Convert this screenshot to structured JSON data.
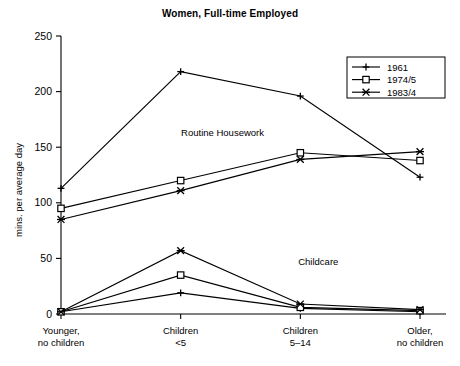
{
  "chart_data": {
    "type": "line",
    "title": "Women, Full-time Employed",
    "xlabel": "",
    "ylabel": "mins. per average day",
    "ylim": [
      0,
      250
    ],
    "yticks": [
      0,
      50,
      100,
      150,
      200,
      250
    ],
    "ytick_labels": [
      "0",
      "50",
      "100",
      "150",
      "200",
      "250"
    ],
    "grid": false,
    "legend_position": "top-right",
    "categories": [
      "Younger,\nno children",
      "Children\n<5",
      "Children\n5–14",
      "Older,\nno children"
    ],
    "category_lines": [
      [
        "Younger,",
        "no children"
      ],
      [
        "Children",
        "<5"
      ],
      [
        "Children",
        "5–14"
      ],
      [
        "Older,",
        "no children"
      ]
    ],
    "annotations": [
      {
        "text": "Routine Housework",
        "x_cat": 1.35,
        "y": 160
      },
      {
        "text": "Childcare",
        "x_cat": 2.15,
        "y": 44
      }
    ],
    "groups": [
      {
        "name": "Routine Housework",
        "series": [
          {
            "name": "1961",
            "marker": "plus",
            "values": [
              113,
              218,
              196,
              123
            ]
          },
          {
            "name": "1974/5",
            "marker": "square",
            "values": [
              95,
              120,
              145,
              138
            ]
          },
          {
            "name": "1983/4",
            "marker": "cross",
            "values": [
              85,
              111,
              139,
              146
            ]
          }
        ]
      },
      {
        "name": "Childcare",
        "series": [
          {
            "name": "1961",
            "marker": "plus",
            "values": [
              2,
              19,
              5,
              2
            ]
          },
          {
            "name": "1974/5",
            "marker": "square",
            "values": [
              2,
              35,
              6,
              3
            ]
          },
          {
            "name": "1983/4",
            "marker": "cross",
            "values": [
              2,
              57,
              9,
              4
            ]
          }
        ]
      }
    ]
  },
  "legend": {
    "entries": [
      {
        "label": "1961",
        "marker": "plus"
      },
      {
        "label": "1974/5",
        "marker": "square"
      },
      {
        "label": "1983/4",
        "marker": "cross"
      }
    ]
  }
}
